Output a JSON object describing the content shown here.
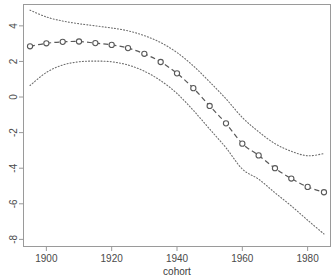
{
  "chart_data": {
    "type": "line",
    "title": "",
    "subtitle": "",
    "xlabel": "cohort",
    "ylabel": "",
    "xlim": [
      1893,
      1987
    ],
    "ylim": [
      -8.4,
      5.2
    ],
    "grid": false,
    "legend": null,
    "x_ticks": [
      1900,
      1920,
      1940,
      1960,
      1980
    ],
    "x_tick_labels": [
      "1900",
      "1920",
      "1940",
      "1960",
      "1980"
    ],
    "y_ticks": [
      4,
      2,
      0,
      -2,
      -4,
      -6,
      -8
    ],
    "y_tick_labels": [
      "4",
      "2",
      "0",
      "-2",
      "-4",
      "-6",
      "-8"
    ],
    "x": [
      1895,
      1900,
      1905,
      1910,
      1915,
      1920,
      1925,
      1930,
      1935,
      1940,
      1945,
      1950,
      1955,
      1960,
      1965,
      1970,
      1975,
      1980,
      1985
    ],
    "series": [
      {
        "name": "estimate",
        "style": "dashed-line-with-open-circles",
        "color": "#595959",
        "values": [
          2.85,
          3.02,
          3.1,
          3.12,
          3.03,
          2.93,
          2.75,
          2.43,
          1.97,
          1.33,
          0.5,
          -0.5,
          -1.48,
          -2.62,
          -3.28,
          -4.0,
          -4.58,
          -5.05,
          -5.35
        ]
      },
      {
        "name": "upper confidence band",
        "style": "dotted-line",
        "color": "#6e6e6e",
        "values": [
          4.88,
          4.5,
          4.27,
          4.12,
          4.0,
          3.88,
          3.72,
          3.45,
          3.06,
          2.5,
          1.75,
          0.85,
          -0.1,
          -1.15,
          -1.95,
          -2.62,
          -3.05,
          -3.3,
          -3.18
        ]
      },
      {
        "name": "lower confidence band",
        "style": "dotted-line",
        "color": "#6e6e6e",
        "values": [
          0.65,
          1.38,
          1.8,
          1.98,
          2.02,
          1.98,
          1.8,
          1.45,
          0.92,
          0.2,
          -0.75,
          -1.8,
          -2.85,
          -4.05,
          -4.62,
          -5.38,
          -6.12,
          -6.92,
          -7.7
        ]
      }
    ]
  },
  "axis": {
    "x_title": "cohort"
  }
}
